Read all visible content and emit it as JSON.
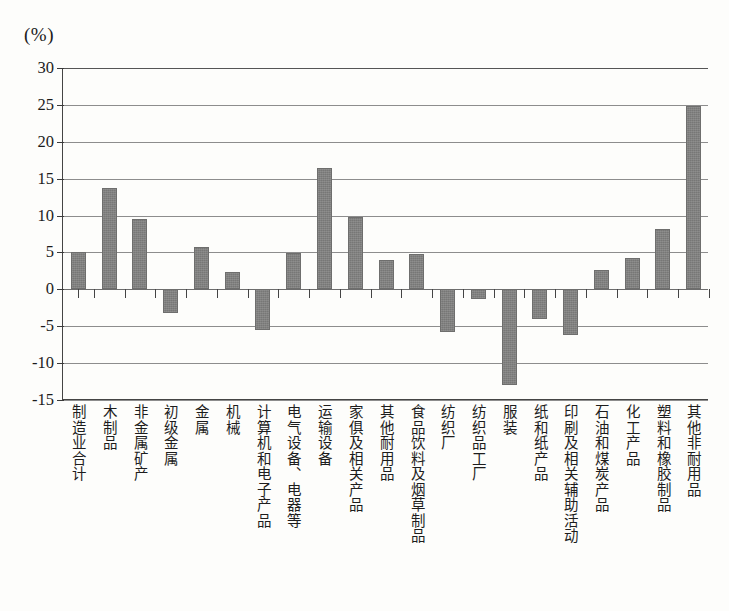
{
  "unit_label": "(%)",
  "chart_data": {
    "type": "bar",
    "title": "",
    "subtitle": "",
    "xlabel": "",
    "ylabel": "(%)",
    "ylim": [
      -15,
      30
    ],
    "ytick_step": 5,
    "yticks": [
      30,
      25,
      20,
      15,
      10,
      5,
      0,
      -5,
      -10,
      -15
    ],
    "ytick_labels": [
      "30",
      "25",
      "20",
      "15",
      "10",
      "5",
      "0",
      "-5",
      "-10",
      "-15"
    ],
    "grid": true,
    "grid_axis": "y",
    "legend": false,
    "legend_position": "none",
    "bar_color": "#777776",
    "axis_color": "#444444",
    "background": "#fdfdfb",
    "categories": [
      "制造业合计",
      "木制品",
      "非金属矿产",
      "初级金属",
      "金属",
      "机械",
      "计算机和电子产品",
      "电气设备、电器等",
      "运输设备",
      "家俱及相关产品",
      "其他耐用品",
      "食品饮料及烟草制品",
      "纺织厂",
      "纺织品工厂",
      "服装",
      "纸和纸产品",
      "印刷及相关辅助活动",
      "石油和煤炭产品",
      "化工产品",
      "塑料和橡胶制品",
      "其他非耐用品"
    ],
    "values": [
      5.0,
      13.8,
      9.5,
      -3.2,
      5.8,
      2.4,
      -5.5,
      4.9,
      16.4,
      9.8,
      4.0,
      4.8,
      -5.8,
      -1.3,
      -13.0,
      -4.0,
      -6.2,
      2.6,
      4.2,
      8.2,
      24.8
    ]
  }
}
